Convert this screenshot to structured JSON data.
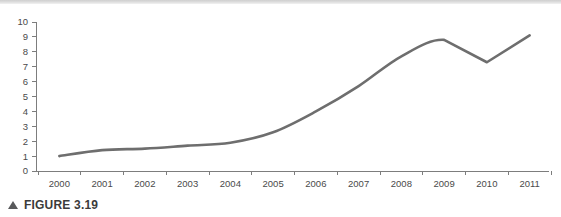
{
  "figure": {
    "caption_marker": "triangle-up-icon",
    "caption_text": "FIGURE 3.19"
  },
  "chart_data": {
    "type": "line",
    "title": "",
    "subtitle": "",
    "xlabel": "",
    "ylabel": "",
    "categories": [
      "2000",
      "2001",
      "2002",
      "2003",
      "2004",
      "2005",
      "2006",
      "2007",
      "2008",
      "2009",
      "2010",
      "2011"
    ],
    "x": [
      2000,
      2001,
      2002,
      2003,
      2004,
      2005,
      2006,
      2007,
      2008,
      2009,
      2010,
      2011
    ],
    "values": [
      1.0,
      1.4,
      1.5,
      1.7,
      1.9,
      2.6,
      4.0,
      5.7,
      7.7,
      8.8,
      7.3,
      9.1
    ],
    "series": [
      {
        "name": "",
        "values": [
          1.0,
          1.4,
          1.5,
          1.7,
          1.9,
          2.6,
          4.0,
          5.7,
          7.7,
          8.8,
          7.3,
          9.1
        ],
        "color": "#6e6e6e",
        "smooth": true
      }
    ],
    "ylim": [
      0,
      10
    ],
    "ytick_labels": [
      "0",
      "1",
      "2",
      "3",
      "4",
      "5",
      "6",
      "7",
      "8",
      "9",
      "10"
    ],
    "ytick_values": [
      0,
      1,
      2,
      3,
      4,
      5,
      6,
      7,
      8,
      9,
      10
    ],
    "xtick_labels": [
      "2000",
      "2001",
      "2002",
      "2003",
      "2004",
      "2005",
      "2006",
      "2007",
      "2008",
      "2009",
      "2010",
      "2011"
    ],
    "grid": false,
    "legend": false,
    "legend_position": "none",
    "axis_color": "#7d7d7d",
    "tick_label_color": "#4a4a4a",
    "line_width": 2.6,
    "annotations": []
  },
  "colors": {
    "line": "#6e6e6e",
    "axis": "#7d7d7d",
    "tick_text": "#4a4a4a",
    "caption_text": "#3b3b3b",
    "caption_marker": "#58595b",
    "top_rule": "#d4d4d4",
    "background": "#ffffff"
  }
}
